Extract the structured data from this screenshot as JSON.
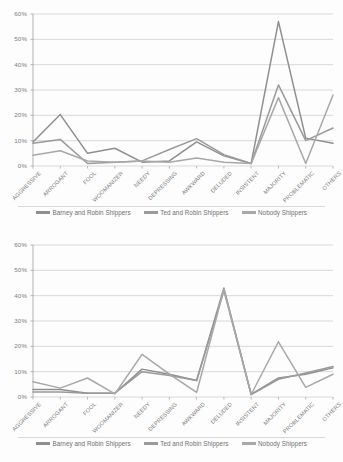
{
  "colors": {
    "series_barney": "#8f8f8f",
    "series_ted": "#9a9a9a",
    "series_nobody": "#a8a8a8",
    "gridline": "#c8c8c8",
    "axis": "#9e9e9e",
    "text": "#7a7a7a",
    "background": "#fdfdfd"
  },
  "legend": {
    "items": [
      {
        "label": "Barney and Robin Shippers",
        "color": "#8f8f8f"
      },
      {
        "label": "Ted and Robin Shippers",
        "color": "#9a9a9a"
      },
      {
        "label": "Nobody Shippers",
        "color": "#a8a8a8"
      }
    ]
  },
  "chart_data": [
    {
      "type": "line",
      "title": "",
      "xlabel": "",
      "ylabel": "",
      "ylim": [
        0,
        60
      ],
      "ytick_labels": [
        "0%",
        "10%",
        "20%",
        "30%",
        "40%",
        "50%",
        "60%"
      ],
      "ytick_values": [
        0,
        10,
        20,
        30,
        40,
        50,
        60
      ],
      "grid": true,
      "legend_position": "bottom",
      "categories": [
        "AGGRESSIVE",
        "ARROGANT",
        "FOOL",
        "WOOMANIZER",
        "NEEDY",
        "DEPRESSING",
        "AWKWARD",
        "DELUDED",
        "INSISTENT",
        "MAJORITY",
        "PROBLEMATIC",
        "OTHERS"
      ],
      "series": [
        {
          "name": "Barney and Robin Shippers",
          "color": "#8f8f8f",
          "values": [
            9.5,
            20.3,
            5.0,
            7.0,
            1.5,
            2.0,
            9.5,
            4.0,
            1.0,
            57.0,
            11.0,
            9.0
          ]
        },
        {
          "name": "Ted and Robin Shippers",
          "color": "#9a9a9a",
          "values": [
            9.0,
            10.5,
            1.0,
            1.5,
            2.0,
            6.5,
            10.8,
            4.5,
            1.0,
            32.0,
            10.0,
            15.0
          ]
        },
        {
          "name": "Nobody Shippers",
          "color": "#a8a8a8",
          "values": [
            4.2,
            6.0,
            2.0,
            1.5,
            2.0,
            1.5,
            3.2,
            1.5,
            1.0,
            27.0,
            1.0,
            28.0
          ]
        }
      ]
    },
    {
      "type": "line",
      "title": "",
      "xlabel": "",
      "ylabel": "",
      "ylim": [
        0,
        60
      ],
      "ytick_labels": [
        "0%",
        "10%",
        "20%",
        "30%",
        "40%",
        "50%",
        "60%"
      ],
      "ytick_values": [
        0,
        10,
        20,
        30,
        40,
        50,
        60
      ],
      "grid": true,
      "legend_position": "bottom",
      "categories": [
        "AGGRESSIVE",
        "ARROGANT",
        "FOOL",
        "WOOMANIZER",
        "NEEDY",
        "DEPRESSING",
        "AWKWARD",
        "DELUDED",
        "INSISTENT",
        "MAJORITY",
        "PROBLEMATIC",
        "OTHERS"
      ],
      "series": [
        {
          "name": "Barney and Robin Shippers",
          "color": "#8f8f8f",
          "values": [
            3.0,
            3.0,
            1.5,
            1.5,
            11.0,
            9.0,
            6.5,
            43.0,
            1.0,
            7.5,
            9.0,
            11.5
          ]
        },
        {
          "name": "Ted and Robin Shippers",
          "color": "#9a9a9a",
          "values": [
            2.0,
            2.0,
            1.5,
            1.5,
            10.0,
            8.5,
            6.5,
            42.0,
            1.0,
            7.0,
            9.5,
            12.0
          ]
        },
        {
          "name": "Nobody Shippers",
          "color": "#a8a8a8",
          "values": [
            6.0,
            3.5,
            7.5,
            1.2,
            16.8,
            9.0,
            1.8,
            42.5,
            1.0,
            21.8,
            3.8,
            9.0
          ]
        }
      ]
    }
  ]
}
